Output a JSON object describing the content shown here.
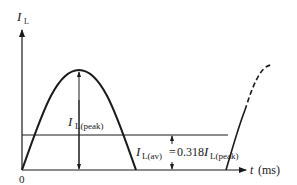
{
  "diagram": {
    "y_axis_label": "I",
    "y_axis_label_sub": "L",
    "x_axis_label": "t",
    "x_axis_unit": "(ms)",
    "origin_label": "0",
    "peak_label": "I",
    "peak_label_sub": "L(peak)",
    "avg_label": "I",
    "avg_label_sub": "L(av)",
    "avg_equation_eq": "=",
    "avg_equation_coef": "0.318",
    "avg_equation_I": "I",
    "avg_equation_sub": "L(peak)",
    "colors": {
      "line": "#1a1a1a",
      "background": "#ffffff"
    }
  }
}
